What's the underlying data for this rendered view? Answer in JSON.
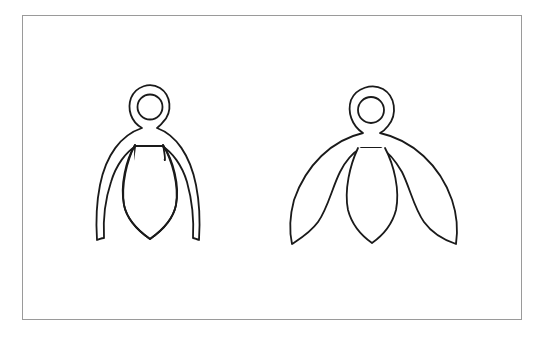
{
  "figure": {
    "background": "#ffffff",
    "frame_color": "#9a9a9a",
    "stroke_color": "#1a1a1a",
    "panels": [
      {
        "id": "left-figure",
        "description": "Outline of ring-topped form with two slender curved legs and a central pointed petal"
      },
      {
        "id": "right-figure",
        "description": "Outline of ring-topped form with two broad pointed wings and a central pointed petal"
      }
    ]
  }
}
